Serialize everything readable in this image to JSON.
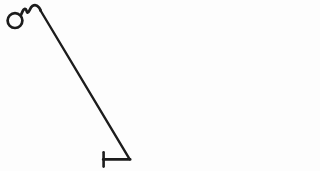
{
  "document": {
    "title": "Line Drawing",
    "caption": "",
    "background_color": "#fdfdfd",
    "ink_color": "#1c1c1c",
    "width": 140,
    "height": 171
  },
  "drawing": {
    "type": "line-art-sketch",
    "description": "Black ink sketch: a small open circle at the upper left joined by a short S-curl to a long straight diagonal stroke descending to the lower right, terminating at a short horizontal bar capped with a vertical tick at its left end.",
    "strokes": [
      {
        "name": "loop-circle",
        "shape": "circle",
        "cx": 15,
        "cy": 20.5,
        "r": 7.5,
        "stroke_width": 2.6
      },
      {
        "name": "neck-curl",
        "shape": "path",
        "d": "M 21.0 15.6 C 22.6 12.6 23.2 9.6 25.0 9.2 C 26.8 8.8 26.4 12.4 27.6 12.8 C 29.0 13.2 29.6 8.0 32.4 6.2 C 34.6 4.8 36.6 5.4 38.4 7.4",
        "stroke_width": 2.8
      },
      {
        "name": "main-diagonal",
        "shape": "path",
        "d": "M 38.4 7.4 C 44.0 13.8 52.0 23.0 60.0 32.0 L 129.5 159.0",
        "stroke_width": 2.4
      },
      {
        "name": "diagonal-straight",
        "shape": "line",
        "x1": 40.5,
        "y1": 10.5,
        "x2": 129.5,
        "y2": 159.5,
        "stroke_width": 2.4
      },
      {
        "name": "base-horizontal-bar",
        "shape": "line",
        "x1": 103.0,
        "y1": 159.5,
        "x2": 130.0,
        "y2": 159.5,
        "stroke_width": 2.6
      },
      {
        "name": "base-left-tick",
        "shape": "line",
        "x1": 103.5,
        "y1": 152.5,
        "x2": 103.5,
        "y2": 166.5,
        "stroke_width": 2.6
      }
    ]
  },
  "labels": {
    "figure_alt": "Hand drawn symbol with a circular head, curled neck and a long diagonal shaft ending in a T shaped foot."
  }
}
